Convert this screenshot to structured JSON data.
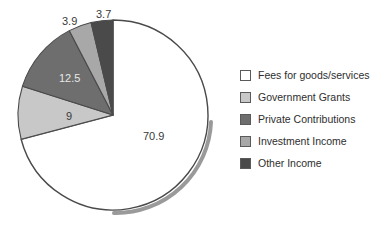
{
  "chart_data": {
    "type": "pie",
    "title": "",
    "categories": [
      "Fees for goods/services",
      "Government Grants",
      "Private Contributions",
      "Investment Income",
      "Other Income"
    ],
    "values": [
      70.9,
      9,
      12.5,
      3.9,
      3.7
    ],
    "value_labels": [
      "70.9",
      "9",
      "12.5",
      "3.9",
      "3.7"
    ],
    "colors": [
      "#ffffff",
      "#c8c8c8",
      "#6e6e6e",
      "#a8a8a8",
      "#4a4a4a"
    ],
    "unit": "percent",
    "total": 100.0,
    "start_angle_deg": 0,
    "direction": "clockwise",
    "legend_position": "right",
    "grid": false,
    "xlabel": "",
    "ylabel": ""
  },
  "legend": {
    "items": [
      {
        "label": "Fees for goods/services",
        "color": "#ffffff",
        "name": "fees-for-goods-services"
      },
      {
        "label": "Government Grants",
        "color": "#c8c8c8",
        "name": "government-grants"
      },
      {
        "label": "Private Contributions",
        "color": "#6e6e6e",
        "name": "private-contributions"
      },
      {
        "label": "Investment Income",
        "color": "#a8a8a8",
        "name": "investment-income"
      },
      {
        "label": "Other Income",
        "color": "#4a4a4a",
        "name": "other-income"
      }
    ]
  },
  "labels": {
    "fees": "70.9",
    "grants": "9",
    "private": "12.5",
    "investment": "3.9",
    "other": "3.7"
  },
  "style": {
    "outline_color": "#4a4a4a",
    "shadow_color": "#9a9a9a",
    "label_color": "#3a3a3a",
    "label_color_light": "#e8e8e8",
    "background": "#ffffff"
  }
}
